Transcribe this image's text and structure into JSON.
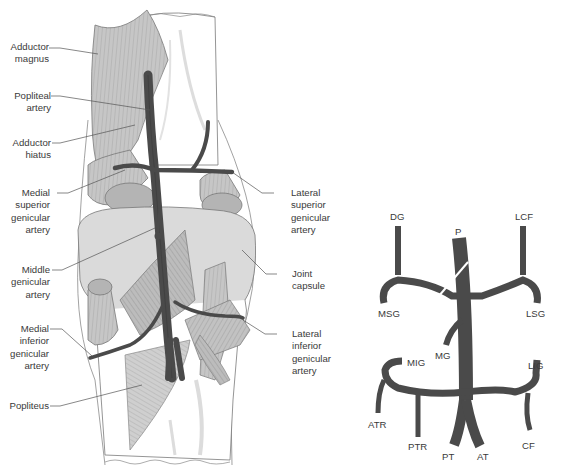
{
  "figure": {
    "left_panel": {
      "description": "Posterior view of the knee showing the popliteal artery and genicular branches",
      "labels_left": [
        {
          "id": "adductor-magnus",
          "lines": [
            "Adductor",
            "magnus"
          ]
        },
        {
          "id": "popliteal-artery",
          "lines": [
            "Popliteal",
            "artery"
          ]
        },
        {
          "id": "adductor-hiatus",
          "lines": [
            "Adductor",
            "hiatus"
          ]
        },
        {
          "id": "medial-superior-genicular-artery",
          "lines": [
            "Medial",
            "superior",
            "genicular",
            "artery"
          ]
        },
        {
          "id": "middle-genicular-artery",
          "lines": [
            "Middle",
            "genicular",
            "artery"
          ]
        },
        {
          "id": "medial-inferior-genicular-artery",
          "lines": [
            "Medial",
            "inferior",
            "genicular",
            "artery"
          ]
        },
        {
          "id": "popliteus",
          "lines": [
            "Popliteus"
          ]
        }
      ],
      "labels_right": [
        {
          "id": "lateral-superior-genicular-artery",
          "lines": [
            "Lateral",
            "superior",
            "genicular",
            "artery"
          ]
        },
        {
          "id": "joint-capsule",
          "lines": [
            "Joint",
            "capsule"
          ]
        },
        {
          "id": "lateral-inferior-genicular-artery",
          "lines": [
            "Lateral",
            "inferior",
            "genicular",
            "artery"
          ]
        }
      ]
    },
    "right_panel": {
      "description": "Schematic of popliteal artery branches",
      "labels": {
        "dg": "DG",
        "p": "P",
        "lcf": "LCF",
        "msg": "MSG",
        "lsg": "LSG",
        "mg": "MG",
        "mig": "MIG",
        "lig": "LIG",
        "atr": "ATR",
        "ptr": "PTR",
        "pt": "PT",
        "at": "AT",
        "cf": "CF"
      }
    },
    "colors": {
      "artery": "#4a4a4a",
      "muscle": "#c4c4c4",
      "capsule": "#dadada",
      "bone": "#ffffff",
      "outline": "#6a6a6a",
      "text": "#3a3a3a"
    }
  }
}
